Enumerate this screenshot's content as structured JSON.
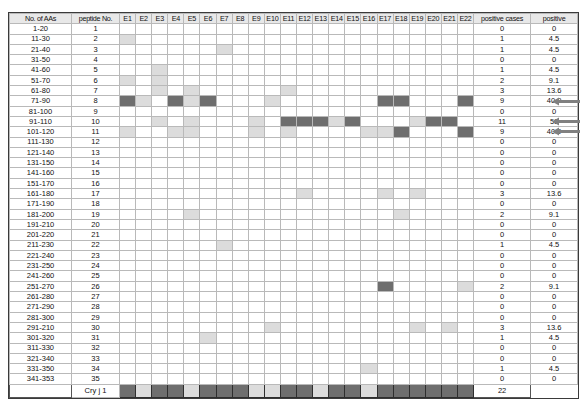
{
  "figure": {
    "headers": {
      "aas": "No. of AAs",
      "peptide": "peptide No.",
      "epitopes": [
        "E1",
        "E2",
        "E3",
        "E4",
        "E5",
        "E6",
        "E7",
        "E8",
        "E9",
        "E10",
        "E11",
        "E12",
        "E13",
        "E14",
        "E15",
        "E16",
        "E17",
        "E18",
        "E19",
        "E20",
        "E21",
        "E22"
      ],
      "positive_cases": "positive cases",
      "positive_pct": "positive"
    },
    "colors": {
      "shade_none": "#ffffff",
      "shade_light": "#dcdcdc",
      "shade_dark": "#6e6e6e",
      "grid": "#b9b9b9",
      "frame": "#3a3a3a",
      "arrow": "#808080"
    },
    "footer_row": {
      "label": "Cry j 1",
      "positive_cases": "22",
      "positive_pct": "",
      "cells": [
        2,
        1,
        2,
        2,
        1,
        2,
        2,
        2,
        1,
        1,
        2,
        2,
        1,
        2,
        2,
        1,
        2,
        2,
        2,
        2,
        2,
        2
      ]
    },
    "arrow_rows": [
      8,
      10,
      11
    ],
    "rows": [
      {
        "aas": "1-20",
        "peptide": "1",
        "cells": [
          0,
          0,
          0,
          0,
          0,
          0,
          0,
          0,
          0,
          0,
          0,
          0,
          0,
          0,
          0,
          0,
          0,
          0,
          0,
          0,
          0,
          0
        ],
        "positive_cases": "0",
        "positive_pct": "0"
      },
      {
        "aas": "11-30",
        "peptide": "2",
        "cells": [
          1,
          0,
          0,
          0,
          0,
          0,
          0,
          0,
          0,
          0,
          0,
          0,
          0,
          0,
          0,
          0,
          0,
          0,
          0,
          0,
          0,
          0
        ],
        "positive_cases": "1",
        "positive_pct": "4.5"
      },
      {
        "aas": "21-40",
        "peptide": "3",
        "cells": [
          0,
          0,
          0,
          0,
          0,
          0,
          1,
          0,
          0,
          0,
          0,
          0,
          0,
          0,
          0,
          0,
          0,
          0,
          0,
          0,
          0,
          0
        ],
        "positive_cases": "1",
        "positive_pct": "4.5"
      },
      {
        "aas": "31-50",
        "peptide": "4",
        "cells": [
          0,
          0,
          0,
          0,
          0,
          0,
          0,
          0,
          0,
          0,
          0,
          0,
          0,
          0,
          0,
          0,
          0,
          0,
          0,
          0,
          0,
          0
        ],
        "positive_cases": "0",
        "positive_pct": "0"
      },
      {
        "aas": "41-60",
        "peptide": "5",
        "cells": [
          0,
          0,
          1,
          0,
          0,
          0,
          0,
          0,
          0,
          0,
          0,
          0,
          0,
          0,
          0,
          0,
          0,
          0,
          0,
          0,
          0,
          0
        ],
        "positive_cases": "1",
        "positive_pct": "4.5"
      },
      {
        "aas": "51-70",
        "peptide": "6",
        "cells": [
          1,
          0,
          1,
          0,
          0,
          0,
          0,
          0,
          0,
          0,
          0,
          0,
          0,
          0,
          0,
          0,
          0,
          0,
          0,
          0,
          0,
          0
        ],
        "positive_cases": "2",
        "positive_pct": "9.1"
      },
      {
        "aas": "61-80",
        "peptide": "7",
        "cells": [
          0,
          0,
          1,
          0,
          1,
          0,
          0,
          0,
          0,
          0,
          1,
          0,
          0,
          0,
          0,
          0,
          0,
          0,
          0,
          0,
          0,
          0
        ],
        "positive_cases": "3",
        "positive_pct": "13.6"
      },
      {
        "aas": "71-90",
        "peptide": "8",
        "cells": [
          2,
          1,
          0,
          2,
          1,
          2,
          0,
          0,
          0,
          1,
          0,
          0,
          0,
          0,
          0,
          0,
          2,
          2,
          0,
          0,
          0,
          2
        ],
        "positive_cases": "9",
        "positive_pct": "40.9"
      },
      {
        "aas": "81-100",
        "peptide": "9",
        "cells": [
          0,
          0,
          0,
          0,
          0,
          0,
          0,
          0,
          0,
          0,
          0,
          0,
          0,
          0,
          0,
          0,
          0,
          0,
          0,
          0,
          0,
          0
        ],
        "positive_cases": "0",
        "positive_pct": "0"
      },
      {
        "aas": "91-110",
        "peptide": "10",
        "cells": [
          0,
          0,
          1,
          0,
          1,
          0,
          0,
          0,
          1,
          0,
          2,
          2,
          2,
          1,
          2,
          0,
          0,
          0,
          1,
          2,
          2,
          0
        ],
        "positive_cases": "11",
        "positive_pct": "50"
      },
      {
        "aas": "101-120",
        "peptide": "11",
        "cells": [
          1,
          0,
          0,
          1,
          1,
          0,
          0,
          0,
          1,
          0,
          1,
          0,
          0,
          0,
          0,
          1,
          1,
          2,
          0,
          0,
          0,
          2
        ],
        "positive_cases": "9",
        "positive_pct": "40.9"
      },
      {
        "aas": "111-130",
        "peptide": "12",
        "cells": [
          0,
          0,
          0,
          0,
          0,
          0,
          0,
          0,
          0,
          0,
          0,
          0,
          0,
          0,
          0,
          0,
          0,
          0,
          0,
          0,
          0,
          0
        ],
        "positive_cases": "0",
        "positive_pct": "0"
      },
      {
        "aas": "121-140",
        "peptide": "13",
        "cells": [
          0,
          0,
          0,
          0,
          0,
          0,
          0,
          0,
          0,
          0,
          0,
          0,
          0,
          0,
          0,
          0,
          0,
          0,
          0,
          0,
          0,
          0
        ],
        "positive_cases": "0",
        "positive_pct": "0"
      },
      {
        "aas": "131-150",
        "peptide": "14",
        "cells": [
          0,
          0,
          0,
          0,
          0,
          0,
          0,
          0,
          0,
          0,
          0,
          0,
          0,
          0,
          0,
          0,
          0,
          0,
          0,
          0,
          0,
          0
        ],
        "positive_cases": "0",
        "positive_pct": "0"
      },
      {
        "aas": "141-160",
        "peptide": "15",
        "cells": [
          0,
          0,
          0,
          0,
          0,
          0,
          0,
          0,
          0,
          0,
          0,
          0,
          0,
          0,
          0,
          0,
          0,
          0,
          0,
          0,
          0,
          0
        ],
        "positive_cases": "0",
        "positive_pct": "0"
      },
      {
        "aas": "151-170",
        "peptide": "16",
        "cells": [
          0,
          0,
          0,
          0,
          0,
          0,
          0,
          0,
          0,
          0,
          0,
          0,
          0,
          0,
          0,
          0,
          0,
          0,
          0,
          0,
          0,
          0
        ],
        "positive_cases": "0",
        "positive_pct": "0"
      },
      {
        "aas": "161-180",
        "peptide": "17",
        "cells": [
          0,
          0,
          0,
          0,
          0,
          0,
          0,
          0,
          0,
          0,
          0,
          1,
          0,
          0,
          0,
          0,
          1,
          0,
          1,
          0,
          0,
          0
        ],
        "positive_cases": "3",
        "positive_pct": "13.6"
      },
      {
        "aas": "171-190",
        "peptide": "18",
        "cells": [
          0,
          0,
          0,
          0,
          0,
          0,
          0,
          0,
          0,
          0,
          0,
          0,
          0,
          0,
          0,
          0,
          0,
          0,
          0,
          0,
          0,
          0
        ],
        "positive_cases": "0",
        "positive_pct": "0"
      },
      {
        "aas": "181-200",
        "peptide": "19",
        "cells": [
          0,
          0,
          0,
          0,
          1,
          0,
          0,
          0,
          0,
          0,
          0,
          0,
          0,
          0,
          0,
          0,
          0,
          1,
          0,
          0,
          0,
          0
        ],
        "positive_cases": "2",
        "positive_pct": "9.1"
      },
      {
        "aas": "191-210",
        "peptide": "20",
        "cells": [
          0,
          0,
          0,
          0,
          0,
          0,
          0,
          0,
          0,
          0,
          0,
          0,
          0,
          0,
          0,
          0,
          0,
          0,
          0,
          0,
          0,
          0
        ],
        "positive_cases": "0",
        "positive_pct": "0"
      },
      {
        "aas": "201-220",
        "peptide": "21",
        "cells": [
          0,
          0,
          0,
          0,
          0,
          0,
          0,
          0,
          0,
          0,
          0,
          0,
          0,
          0,
          0,
          0,
          0,
          0,
          0,
          0,
          0,
          0
        ],
        "positive_cases": "0",
        "positive_pct": "0"
      },
      {
        "aas": "211-230",
        "peptide": "22",
        "cells": [
          0,
          0,
          0,
          0,
          0,
          0,
          1,
          0,
          0,
          0,
          0,
          0,
          0,
          0,
          0,
          0,
          0,
          0,
          0,
          0,
          0,
          0
        ],
        "positive_cases": "1",
        "positive_pct": "4.5"
      },
      {
        "aas": "221-240",
        "peptide": "23",
        "cells": [
          0,
          0,
          0,
          0,
          0,
          0,
          0,
          0,
          0,
          0,
          0,
          0,
          0,
          0,
          0,
          0,
          0,
          0,
          0,
          0,
          0,
          0
        ],
        "positive_cases": "0",
        "positive_pct": "0"
      },
      {
        "aas": "231-250",
        "peptide": "24",
        "cells": [
          0,
          0,
          0,
          0,
          0,
          0,
          0,
          0,
          0,
          0,
          0,
          0,
          0,
          0,
          0,
          0,
          0,
          0,
          0,
          0,
          0,
          0
        ],
        "positive_cases": "0",
        "positive_pct": "0"
      },
      {
        "aas": "241-260",
        "peptide": "25",
        "cells": [
          0,
          0,
          0,
          0,
          0,
          0,
          0,
          0,
          0,
          0,
          0,
          0,
          0,
          0,
          0,
          0,
          0,
          0,
          0,
          0,
          0,
          0
        ],
        "positive_cases": "0",
        "positive_pct": "0"
      },
      {
        "aas": "251-270",
        "peptide": "26",
        "cells": [
          0,
          0,
          0,
          0,
          0,
          0,
          0,
          0,
          0,
          0,
          0,
          0,
          0,
          0,
          0,
          0,
          2,
          0,
          0,
          0,
          0,
          1
        ],
        "positive_cases": "2",
        "positive_pct": "9.1"
      },
      {
        "aas": "261-280",
        "peptide": "27",
        "cells": [
          0,
          0,
          0,
          0,
          0,
          0,
          0,
          0,
          0,
          0,
          0,
          0,
          0,
          0,
          0,
          0,
          0,
          0,
          0,
          0,
          0,
          0
        ],
        "positive_cases": "0",
        "positive_pct": "0"
      },
      {
        "aas": "271-290",
        "peptide": "28",
        "cells": [
          0,
          0,
          0,
          0,
          0,
          0,
          0,
          0,
          0,
          0,
          0,
          0,
          0,
          0,
          0,
          0,
          0,
          0,
          0,
          0,
          0,
          0
        ],
        "positive_cases": "0",
        "positive_pct": "0"
      },
      {
        "aas": "281-300",
        "peptide": "29",
        "cells": [
          0,
          0,
          0,
          0,
          0,
          0,
          0,
          0,
          0,
          0,
          0,
          0,
          0,
          0,
          0,
          0,
          0,
          0,
          0,
          0,
          0,
          0
        ],
        "positive_cases": "0",
        "positive_pct": "0"
      },
      {
        "aas": "291-210",
        "peptide": "30",
        "cells": [
          0,
          0,
          0,
          0,
          0,
          0,
          0,
          0,
          0,
          1,
          0,
          0,
          0,
          0,
          0,
          0,
          0,
          0,
          1,
          0,
          1,
          0
        ],
        "positive_cases": "3",
        "positive_pct": "13.6"
      },
      {
        "aas": "301-320",
        "peptide": "31",
        "cells": [
          0,
          0,
          0,
          0,
          0,
          1,
          0,
          0,
          0,
          0,
          0,
          0,
          0,
          0,
          0,
          0,
          0,
          0,
          0,
          0,
          0,
          0
        ],
        "positive_cases": "1",
        "positive_pct": "4.5"
      },
      {
        "aas": "311-330",
        "peptide": "32",
        "cells": [
          0,
          0,
          0,
          0,
          0,
          0,
          0,
          0,
          0,
          0,
          0,
          0,
          0,
          0,
          0,
          0,
          0,
          0,
          0,
          0,
          0,
          0
        ],
        "positive_cases": "0",
        "positive_pct": "0"
      },
      {
        "aas": "321-340",
        "peptide": "33",
        "cells": [
          0,
          0,
          0,
          0,
          0,
          0,
          0,
          0,
          0,
          0,
          0,
          0,
          0,
          0,
          0,
          0,
          0,
          0,
          0,
          0,
          0,
          0
        ],
        "positive_cases": "0",
        "positive_pct": "0"
      },
      {
        "aas": "331-350",
        "peptide": "34",
        "cells": [
          0,
          0,
          0,
          0,
          0,
          0,
          0,
          0,
          0,
          0,
          0,
          0,
          0,
          0,
          0,
          1,
          0,
          0,
          0,
          0,
          0,
          0
        ],
        "positive_cases": "1",
        "positive_pct": "4.5"
      },
      {
        "aas": "341-353",
        "peptide": "35",
        "cells": [
          0,
          0,
          0,
          0,
          0,
          0,
          0,
          0,
          0,
          0,
          0,
          0,
          0,
          0,
          0,
          0,
          0,
          0,
          0,
          0,
          0,
          0
        ],
        "positive_cases": "0",
        "positive_pct": "0"
      }
    ]
  },
  "chart_data": {
    "type": "heatmap",
    "title": "",
    "xlabel": "",
    "ylabel": "",
    "x_categories": [
      "E1",
      "E2",
      "E3",
      "E4",
      "E5",
      "E6",
      "E7",
      "E8",
      "E9",
      "E10",
      "E11",
      "E12",
      "E13",
      "E14",
      "E15",
      "E16",
      "E17",
      "E18",
      "E19",
      "E20",
      "E21",
      "E22"
    ],
    "y_categories": [
      "1-20",
      "11-30",
      "21-40",
      "31-50",
      "41-60",
      "51-70",
      "61-80",
      "71-90",
      "81-100",
      "91-110",
      "101-120",
      "111-130",
      "121-140",
      "131-150",
      "141-160",
      "151-170",
      "161-180",
      "171-190",
      "181-200",
      "191-210",
      "201-220",
      "211-230",
      "221-240",
      "231-250",
      "241-260",
      "251-270",
      "261-280",
      "271-290",
      "281-300",
      "291-210",
      "301-320",
      "311-330",
      "321-340",
      "331-350",
      "341-353"
    ],
    "value_scale": {
      "0": "none",
      "1": "weak",
      "2": "strong"
    },
    "positive_cases": [
      0,
      1,
      1,
      0,
      1,
      2,
      3,
      9,
      0,
      11,
      9,
      0,
      0,
      0,
      0,
      0,
      3,
      0,
      2,
      0,
      0,
      1,
      0,
      0,
      0,
      2,
      0,
      0,
      0,
      3,
      1,
      0,
      0,
      1,
      0
    ],
    "positive_percent": [
      0,
      4.5,
      4.5,
      0,
      4.5,
      9.1,
      13.6,
      40.9,
      0,
      50,
      40.9,
      0,
      0,
      0,
      0,
      0,
      13.6,
      0,
      9.1,
      0,
      0,
      4.5,
      0,
      0,
      0,
      9.1,
      0,
      0,
      0,
      13.6,
      4.5,
      0,
      0,
      4.5,
      0
    ],
    "legend": [],
    "grid": true
  }
}
